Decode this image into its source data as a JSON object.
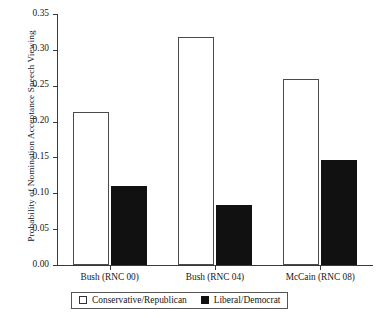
{
  "chart_data": {
    "type": "bar",
    "title": "",
    "xlabel": "",
    "ylabel": "Probability of Nomination Acceptance Speech Viewing",
    "categories": [
      "Bush (RNC 00)",
      "Bush (RNC 04)",
      "McCain (RNC 08)"
    ],
    "series": [
      {
        "name": "Conservative/Republican",
        "style": "open",
        "color": "#ffffff",
        "edge_color": "#4a4a4a",
        "values": [
          0.213,
          0.318,
          0.26
        ]
      },
      {
        "name": "Liberal/Democrat",
        "style": "filled",
        "color": "#111111",
        "edge_color": "#111111",
        "values": [
          0.11,
          0.083,
          0.146
        ]
      }
    ],
    "ylim": [
      0.0,
      0.35
    ],
    "ytick_values": [
      0.0,
      0.05,
      0.1,
      0.15,
      0.2,
      0.25,
      0.3,
      0.35
    ],
    "ytick_labels": [
      "0.00",
      "0.05",
      "0.10",
      "0.15",
      "0.20",
      "0.25",
      "0.30",
      "0.35"
    ],
    "grid": false,
    "legend_position": "bottom-center",
    "legend_entries": [
      "Conservative/Republican",
      "Liberal/Democrat"
    ]
  }
}
